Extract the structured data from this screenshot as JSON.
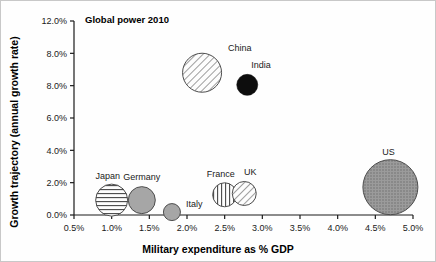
{
  "figure": {
    "title": "Global power 2010",
    "background_color": "#fefefe",
    "border_color": "#c8c8c8"
  },
  "chart_data": {
    "type": "scatter",
    "title": "Global power 2010",
    "xlabel": "Military expenditure as % GDP",
    "ylabel": "Growth trajectory (annual growth rate)",
    "xlim": [
      0.5,
      5.0
    ],
    "ylim": [
      0.0,
      12.0
    ],
    "xticks": [
      "0.5%",
      "1.0%",
      "1.5%",
      "2.0%",
      "2.5%",
      "3.0%",
      "3.5%",
      "4.0%",
      "4.5%",
      "5.0%"
    ],
    "xtick_values": [
      0.5,
      1.0,
      1.5,
      2.0,
      2.5,
      3.0,
      3.5,
      4.0,
      4.5,
      5.0
    ],
    "yticks": [
      "0.0%",
      "2.0%",
      "4.0%",
      "6.0%",
      "8.0%",
      "8.0%",
      "12.0%"
    ],
    "ytick_values": [
      0.0,
      2.0,
      4.0,
      6.0,
      8.0,
      10.0,
      12.0
    ],
    "grid": false,
    "legend": "none",
    "bubble_size_meaning": "relative size of economy / power",
    "points": [
      {
        "name": "China",
        "x": 2.2,
        "y": 8.8,
        "r": 19.5,
        "fill": "diagonal-hatch",
        "label_dx": 26,
        "label_dy": -22,
        "label_anchor": "start"
      },
      {
        "name": "India",
        "x": 2.8,
        "y": 8.05,
        "r": 10.5,
        "fill": "solid-black",
        "label_dx": 4,
        "label_dy": -17,
        "label_anchor": "start"
      },
      {
        "name": "US",
        "x": 4.7,
        "y": 1.72,
        "r": 27.5,
        "fill": "fine-crosshatch",
        "label_dx": -2,
        "label_dy": -32,
        "label_anchor": "middle"
      },
      {
        "name": "Japan",
        "x": 1.0,
        "y": 0.92,
        "r": 16.0,
        "fill": "horizontal-lines",
        "label_dx": -4,
        "label_dy": -21,
        "label_anchor": "middle"
      },
      {
        "name": "Germany",
        "x": 1.4,
        "y": 0.92,
        "r": 13.5,
        "fill": "solid-gray",
        "label_dx": 0,
        "label_dy": -20,
        "label_anchor": "middle"
      },
      {
        "name": "Italy",
        "x": 1.8,
        "y": 0.18,
        "r": 8.5,
        "fill": "solid-gray",
        "label_dx": 14,
        "label_dy": -5,
        "label_anchor": "start"
      },
      {
        "name": "France",
        "x": 2.5,
        "y": 1.25,
        "r": 12.0,
        "fill": "vertical-lines",
        "label_dx": -4,
        "label_dy": -18,
        "label_anchor": "middle"
      },
      {
        "name": "UK",
        "x": 2.76,
        "y": 1.33,
        "r": 12.0,
        "fill": "diagonal-hatch",
        "label_dx": 6,
        "label_dy": -18,
        "label_anchor": "middle"
      }
    ]
  },
  "colors": {
    "axis": "#1a1a1a",
    "text": "#1a1a1a",
    "bubble_stroke": "#4d4d4d",
    "solid_gray": "#a6a6a6",
    "solid_black": "#0d0d0d",
    "hatch_line": "#595959"
  }
}
